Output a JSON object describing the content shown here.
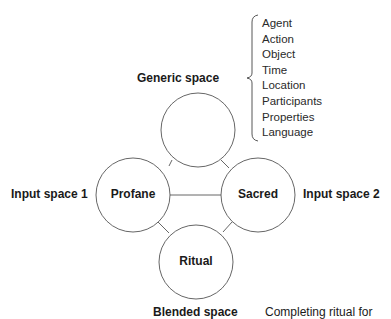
{
  "diagram": {
    "generic_space": {
      "label": "Generic space",
      "elements": [
        "Agent",
        "Action",
        "Object",
        "Time",
        "Location",
        "Participants",
        "Properties",
        "Language"
      ]
    },
    "input_space_1": {
      "label": "Input space 1",
      "node": "Profane"
    },
    "input_space_2": {
      "label": "Input space 2",
      "node": "Sacred"
    },
    "blended_space": {
      "label": "Blended space",
      "node": "Ritual",
      "description": "Completing ritual for"
    }
  }
}
